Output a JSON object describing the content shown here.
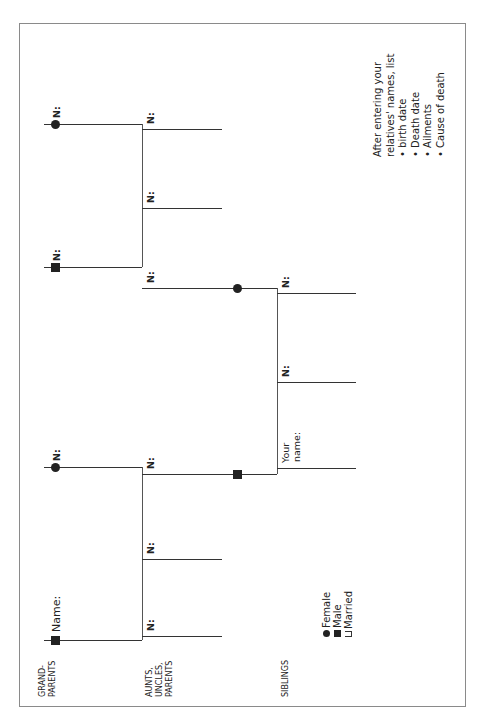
{
  "worksheet": {
    "section_labels": {
      "grandparents": "GRAND-\nPARENTS",
      "grandparents_line1": "GRAND-",
      "grandparents_line2": "PARENTS",
      "aunts_line1": "AUNTS,",
      "aunts_line2": "UNCLES,",
      "aunts_line3": "PARENTS",
      "siblings": "SIBLINGS"
    },
    "grandparents": [
      {
        "label": "Name:",
        "symbol": "male-square"
      },
      {
        "label": "N:",
        "symbol": "female-circle"
      },
      {
        "label": "N:",
        "symbol": "male-square"
      },
      {
        "label": "N:",
        "symbol": "female-circle"
      }
    ],
    "aunts_uncles_parents": [
      {
        "label": "N:"
      },
      {
        "label": "N:"
      },
      {
        "label": "N:"
      },
      {
        "label": "N:"
      },
      {
        "label": "N:"
      },
      {
        "label": "N:"
      }
    ],
    "siblings": [
      {
        "label_line1": "Your",
        "label_line2": "name:"
      },
      {
        "label": "N:"
      },
      {
        "label": "N:"
      }
    ],
    "legend": {
      "female": "Female",
      "male": "Male",
      "married": "Married"
    },
    "instructions": {
      "line1": "After entering your",
      "line2": "relatives' names, list",
      "items": [
        "• birth date",
        "• Death date",
        "• Ailments",
        "• Cause of death"
      ]
    }
  }
}
